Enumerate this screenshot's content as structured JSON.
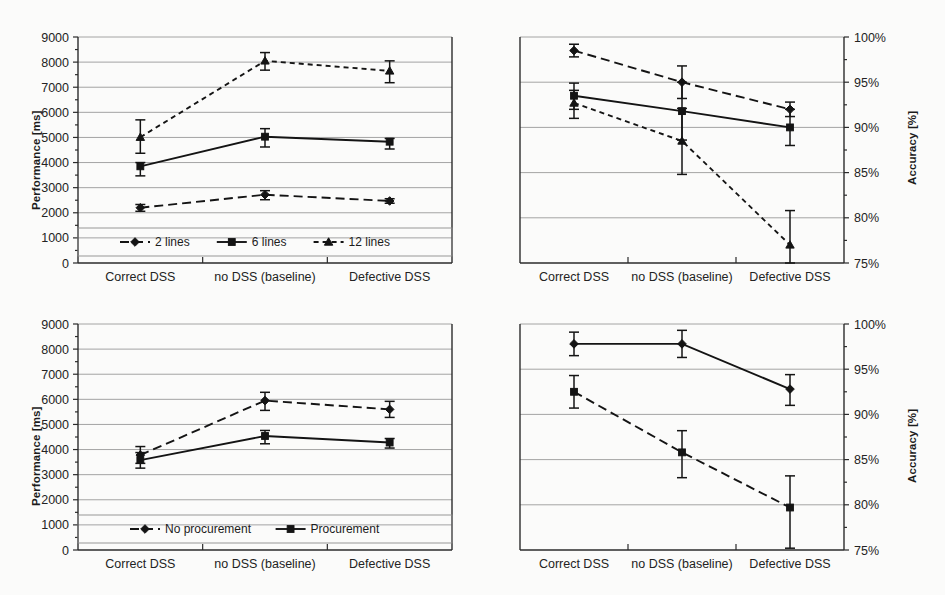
{
  "figure": {
    "background": "#fbfbfa",
    "ink_color": "#141414",
    "grid_color": "#9a9a9a"
  },
  "panels": {
    "top_left": {
      "ylabel": "Performance [ms]",
      "y_ticks": [
        "9000",
        "8000",
        "7000",
        "6000",
        "5000",
        "4000",
        "3000",
        "2000",
        "1000",
        "0"
      ],
      "categories": [
        "Correct DSS",
        "no DSS (baseline)",
        "Defective DSS"
      ],
      "legend": [
        "2 lines",
        "6 lines",
        "12 lines"
      ]
    },
    "top_right": {
      "ylabel": "Accuracy [%]",
      "y_ticks": [
        "100%",
        "95%",
        "90%",
        "85%",
        "80%",
        "75%"
      ],
      "categories": [
        "Correct DSS",
        "no DSS (baseline)",
        "Defective DSS"
      ]
    },
    "bottom_left": {
      "ylabel": "Performance [ms]",
      "y_ticks": [
        "9000",
        "8000",
        "7000",
        "6000",
        "5000",
        "4000",
        "3000",
        "2000",
        "1000",
        "0"
      ],
      "categories": [
        "Correct DSS",
        "no DSS (baseline)",
        "Defective DSS"
      ],
      "legend": [
        "No procurement",
        "Procurement"
      ]
    },
    "bottom_right": {
      "ylabel": "Accuracy [%]",
      "y_ticks": [
        "100%",
        "95%",
        "90%",
        "85%",
        "80%",
        "75%"
      ],
      "categories": [
        "Correct DSS",
        "no DSS (baseline)",
        "Defective DSS"
      ]
    }
  },
  "chart_data": [
    {
      "id": "top_left",
      "type": "line",
      "title": "",
      "xlabel": "",
      "ylabel": "Performance [ms]",
      "ylim": [
        0,
        9000
      ],
      "ytick_step": 1000,
      "grid": true,
      "legend_position": "bottom-inside",
      "categories": [
        "Correct DSS",
        "no DSS (baseline)",
        "Defective DSS"
      ],
      "series": [
        {
          "name": "2 lines",
          "marker": "diamond",
          "linestyle": "dashed",
          "values": [
            2200,
            2720,
            2470
          ],
          "err_low": [
            2060,
            2520,
            2380
          ],
          "err_high": [
            2330,
            2880,
            2560
          ]
        },
        {
          "name": "6 lines",
          "marker": "square",
          "linestyle": "solid",
          "values": [
            3850,
            5030,
            4830
          ],
          "err_low": [
            3470,
            4620,
            4540
          ],
          "err_high": [
            4000,
            5350,
            4960
          ]
        },
        {
          "name": "12 lines",
          "marker": "triangle",
          "linestyle": "dashed",
          "values": [
            5010,
            8050,
            7650
          ],
          "err_low": [
            4370,
            7680,
            7180
          ],
          "err_high": [
            5700,
            8380,
            8050
          ]
        }
      ]
    },
    {
      "id": "top_right",
      "type": "line",
      "title": "",
      "xlabel": "",
      "ylabel": "Accuracy [%]",
      "ylim": [
        75,
        100
      ],
      "ytick_step": 5,
      "grid": true,
      "legend_position": "none",
      "categories": [
        "Correct DSS",
        "no DSS (baseline)",
        "Defective DSS"
      ],
      "series": [
        {
          "name": "2 lines",
          "marker": "diamond",
          "linestyle": "dashed",
          "values": [
            98.5,
            95.0,
            92.0
          ],
          "err_low": [
            97.8,
            93.2,
            91.2
          ],
          "err_high": [
            99.2,
            96.8,
            92.8
          ]
        },
        {
          "name": "6 lines",
          "marker": "square",
          "linestyle": "solid",
          "values": [
            93.5,
            91.8,
            90.0
          ],
          "err_low": [
            92.0,
            88.6,
            88.0
          ],
          "err_high": [
            94.9,
            95.0,
            92.0
          ]
        },
        {
          "name": "12 lines",
          "marker": "triangle",
          "linestyle": "dashed",
          "values": [
            92.7,
            88.5,
            77.0
          ],
          "err_low": [
            91.0,
            84.8,
            75.0
          ],
          "err_high": [
            94.1,
            92.1,
            80.8
          ]
        }
      ]
    },
    {
      "id": "bottom_left",
      "type": "line",
      "title": "",
      "xlabel": "",
      "ylabel": "Performance [ms]",
      "ylim": [
        0,
        9000
      ],
      "ytick_step": 1000,
      "grid": true,
      "legend_position": "bottom-inside",
      "categories": [
        "Correct DSS",
        "no DSS (baseline)",
        "Defective DSS"
      ],
      "series": [
        {
          "name": "No procurement",
          "marker": "diamond",
          "linestyle": "dashed",
          "values": [
            3780,
            5950,
            5600
          ],
          "err_low": [
            3450,
            5560,
            5280
          ],
          "err_high": [
            4120,
            6280,
            5920
          ]
        },
        {
          "name": "Procurement",
          "marker": "square",
          "linestyle": "solid",
          "values": [
            3580,
            4540,
            4280
          ],
          "err_low": [
            3260,
            4230,
            4060
          ],
          "err_high": [
            3880,
            4760,
            4440
          ]
        }
      ]
    },
    {
      "id": "bottom_right",
      "type": "line",
      "title": "",
      "xlabel": "",
      "ylabel": "Accuracy [%]",
      "ylim": [
        75,
        100
      ],
      "ytick_step": 5,
      "grid": true,
      "legend_position": "none",
      "categories": [
        "Correct DSS",
        "no DSS (baseline)",
        "Defective DSS"
      ],
      "series": [
        {
          "name": "Procurement",
          "marker": "diamond",
          "linestyle": "solid",
          "values": [
            97.8,
            97.8,
            92.8
          ],
          "err_low": [
            96.5,
            96.3,
            91.0
          ],
          "err_high": [
            99.1,
            99.3,
            94.4
          ]
        },
        {
          "name": "No procurement",
          "marker": "square",
          "linestyle": "dashed",
          "values": [
            92.5,
            85.8,
            79.7
          ],
          "err_low": [
            90.7,
            83.0,
            75.2
          ],
          "err_high": [
            94.3,
            88.2,
            83.2
          ]
        }
      ]
    }
  ]
}
